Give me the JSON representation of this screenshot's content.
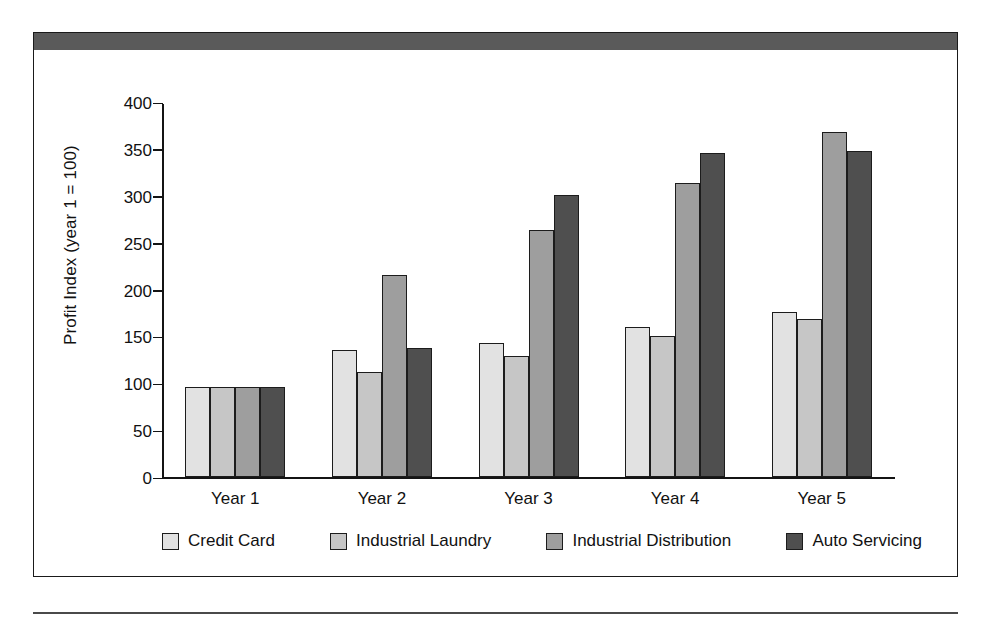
{
  "figure": {
    "header_band_color": "#5a5a5a",
    "frame_border_color": "#1a1a1a"
  },
  "chart_data": {
    "type": "bar",
    "title": "",
    "subtitle": "",
    "xlabel": "",
    "ylabel": "Profit Index (year 1 = 100)",
    "categories": [
      "Year 1",
      "Year 2",
      "Year 3",
      "Year 4",
      "Year 5"
    ],
    "series": [
      {
        "name": "Credit Card",
        "color": "#e2e2e2",
        "values": [
          96,
          136,
          143,
          160,
          176
        ]
      },
      {
        "name": "Industrial Laundry",
        "color": "#c6c6c6",
        "values": [
          96,
          112,
          129,
          151,
          169
        ]
      },
      {
        "name": "Industrial Distribution",
        "color": "#9e9e9e",
        "values": [
          96,
          216,
          264,
          314,
          368
        ]
      },
      {
        "name": "Auto Servicing",
        "color": "#4f4f4f",
        "values": [
          96,
          138,
          301,
          346,
          348
        ]
      }
    ],
    "ylim": [
      0,
      400
    ],
    "yticks": [
      0,
      50,
      100,
      150,
      200,
      250,
      300,
      350,
      400
    ],
    "ytick_labels": [
      "0",
      "50",
      "100",
      "150",
      "200",
      "250",
      "300",
      "350",
      "400"
    ],
    "grid": false,
    "legend_position": "bottom",
    "bar_border_color": "#1c1c1c"
  }
}
